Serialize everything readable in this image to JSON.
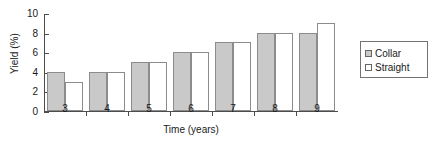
{
  "chart_data": {
    "type": "bar",
    "title": "",
    "xlabel": "Time (years)",
    "ylabel": "Yield (%)",
    "categories": [
      "3",
      "4",
      "5",
      "6",
      "7",
      "8",
      "9"
    ],
    "series": [
      {
        "name": "Collar",
        "color": "#c9c9c9",
        "values": [
          4,
          4,
          5,
          6,
          7,
          8,
          8
        ]
      },
      {
        "name": "Straight",
        "color": "#ffffff",
        "values": [
          3,
          4,
          5,
          6,
          7,
          8,
          9
        ]
      }
    ],
    "ylim": [
      0,
      10
    ],
    "yticks": [
      0,
      2,
      4,
      6,
      8,
      10
    ],
    "ytick_labels": [
      "0",
      "2",
      "4",
      "6",
      "8",
      "10"
    ],
    "xlim": [
      2.5,
      9.5
    ],
    "grid": false,
    "legend": {
      "position": "right",
      "entries": [
        "Collar",
        "Straight"
      ]
    }
  }
}
